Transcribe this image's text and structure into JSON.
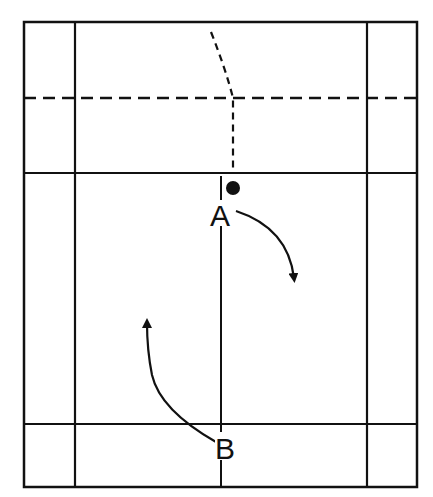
{
  "diagram": {
    "type": "badminton-court-movement",
    "colors": {
      "line": "#111111",
      "background": "#ffffff"
    },
    "players": [
      {
        "id": "A",
        "label": "A",
        "position": "front center, just behind short service line"
      },
      {
        "id": "B",
        "label": "B",
        "position": "rear center, near back boundary"
      }
    ],
    "shuttle": {
      "name": "shuttle-dot",
      "path_style": "dashed"
    },
    "movements": [
      {
        "player": "A",
        "direction": "forward-right curve"
      },
      {
        "player": "B",
        "direction": "forward-left curve"
      }
    ],
    "court_lines": {
      "net_line_style": "dashed",
      "short_service_line_style": "solid",
      "center_line_style": "solid"
    }
  }
}
